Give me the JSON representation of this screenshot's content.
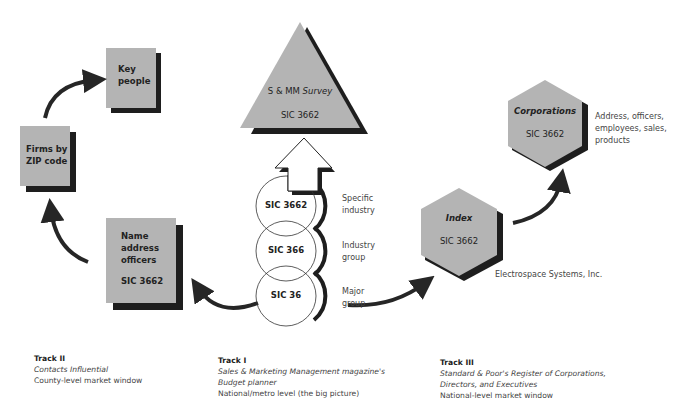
{
  "colors": {
    "shape_fill": "#b4b4b4",
    "shadow": "#1e1e1e",
    "arrow": "#262626",
    "text": "#222222",
    "muted_text": "#444444"
  },
  "track2": {
    "boxes": {
      "key_people": "Key people",
      "key_people_l1": "Key",
      "key_people_l2": "people",
      "firms_l1": "Firms by",
      "firms_l2": "ZIP code",
      "name_l1": "Name",
      "name_l2": "address",
      "name_l3": "officers",
      "name_sic": "SIC 3662"
    },
    "caption": {
      "title": "Track II",
      "line1": "Contacts Influential",
      "line2": "County-level market window"
    }
  },
  "track1": {
    "triangle": {
      "line1_a": "S & MM ",
      "line1_b": "Survey",
      "line2": "SIC 3662"
    },
    "circles": [
      {
        "code": "SIC 3662",
        "label_l1": "Specific",
        "label_l2": "industry"
      },
      {
        "code": "SIC 366",
        "label_l1": "Industry",
        "label_l2": "group"
      },
      {
        "code": "SIC 36",
        "label_l1": "Major",
        "label_l2": "group"
      }
    ],
    "caption": {
      "title": "Track I",
      "line1": "Sales & Marketing Management magazine's",
      "line2": "Budget planner",
      "line3": "National/metro level (the big picture)"
    }
  },
  "track3": {
    "index": {
      "title": "Index",
      "sic": "SIC 3662"
    },
    "corporations": {
      "title": "Corporations",
      "sic": "SIC 3662"
    },
    "corp_note_l1": "Address, officers,",
    "corp_note_l2": "employees, sales,",
    "corp_note_l3": "products",
    "company": "Electrospace Systems, Inc.",
    "caption": {
      "title": "Track III",
      "line1": "Standard & Poor's Register of Corporations,",
      "line2": "Directors, and Executives",
      "line3": "National-level market window"
    }
  }
}
